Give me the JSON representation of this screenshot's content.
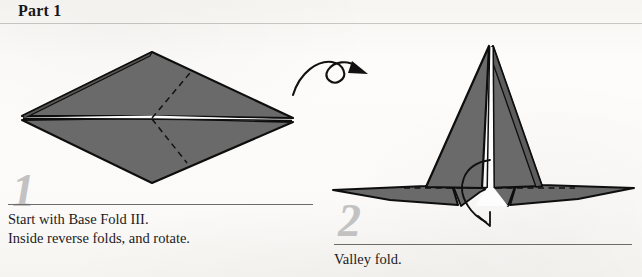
{
  "page": {
    "title": "Part 1",
    "background_color": "#fbfaf8",
    "paper_gray": "#6a6a6a",
    "outline_color": "#111111",
    "step_number_color": "#c2c2c2",
    "rule_color": "#6e6c69"
  },
  "steps": [
    {
      "number": "1",
      "caption": "Start with Base Fold III.\nInside reverse folds, and rotate.",
      "caption_line_1": "Start with Base Fold III.",
      "caption_line_2": "Inside reverse folds, and rotate.",
      "figure_name": "flat-diamond-base-fold-iii",
      "crease_style": "dashed",
      "crease_count": 2
    },
    {
      "number": "2",
      "caption": "Valley fold.",
      "caption_line_1": "Valley fold.",
      "figure_name": "standing-bird-form-with-wings",
      "crease_style": "dashed",
      "crease_count": 2
    }
  ],
  "annotations": [
    {
      "name": "rotate-arrow",
      "kind": "looped-rotation-arrow",
      "meaning": "rotate the model"
    },
    {
      "name": "valley-fold-arrow",
      "kind": "curved-fold-arrow",
      "meaning": "fold downward along dashed line"
    }
  ],
  "figure_1": {
    "description": "Flattened kite/diamond shape seen from above with a horizontal white center seam and two dashed crease lines forming an open V toward the right.",
    "vertices": {
      "left_tip": [
        22,
        118
      ],
      "top": [
        152,
        52
      ],
      "right_tip": [
        293,
        120
      ],
      "bottom": [
        152,
        183
      ],
      "center": [
        152,
        118
      ]
    },
    "creases": [
      {
        "from": [
          152,
          118
        ],
        "to": [
          190,
          73
        ]
      },
      {
        "from": [
          152,
          118
        ],
        "to": [
          187,
          163
        ]
      }
    ]
  },
  "figure_2": {
    "description": "Standing folded form with a tall central peak, a white vertical spine, two lower wings spreading left and right, and a horizontal dashed valley-fold line across the base.",
    "apex": [
      489,
      46
    ],
    "baseline_y": 188,
    "left_wing_tip": [
      333,
      190
    ],
    "right_wing_tip": [
      634,
      188
    ],
    "creases": [
      {
        "from": [
          404,
          188
        ],
        "to": [
          483,
          188
        ]
      },
      {
        "from": [
          495,
          188
        ],
        "to": [
          574,
          188
        ]
      }
    ]
  }
}
